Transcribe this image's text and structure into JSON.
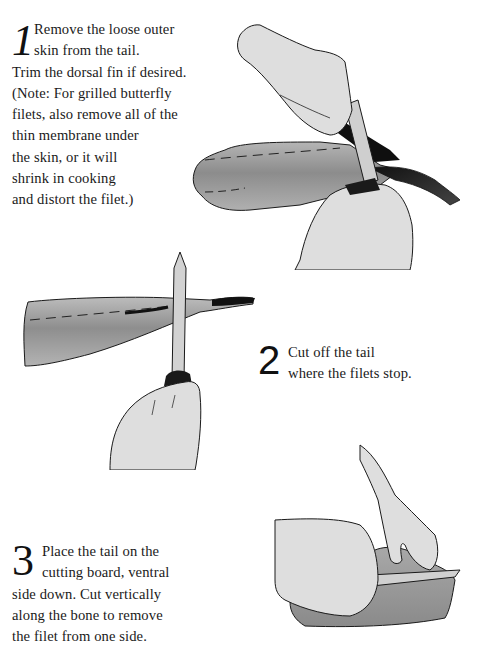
{
  "page": {
    "background": "#ffffff",
    "text_color": "#1a1a1a"
  },
  "steps": [
    {
      "number": "1",
      "lines": [
        "Remove the loose outer",
        "skin from the tail.",
        "Trim the dorsal fin if desired.",
        "(Note: For grilled butterfly",
        "filets, also remove all of the",
        "thin membrane under",
        "the skin, or it will",
        "shrink in cooking",
        "and distort the filet.)"
      ]
    },
    {
      "number": "2",
      "lines": [
        "Cut off the tail",
        "where the filets stop."
      ]
    },
    {
      "number": "3",
      "lines": [
        "Place the tail on the",
        "cutting board, ventral",
        "side down. Cut vertically",
        "along the bone to remove",
        "the filet from one side."
      ]
    }
  ],
  "illustrations": [
    {
      "id": "illus1",
      "subject": "hands-peeling-skin-from-fish-tail-icon"
    },
    {
      "id": "illus2",
      "subject": "hand-with-knife-cutting-tail-icon"
    },
    {
      "id": "illus3",
      "subject": "hands-filleting-tail-on-board-icon"
    }
  ],
  "colors": {
    "skin_fill": "#dedede",
    "fish_fill": "#9a9a9a",
    "fish_dark": "#7a7a7a",
    "knife_fill": "#cfcfcf",
    "outline": "#1a1a1a",
    "fin_dark": "#111111"
  }
}
